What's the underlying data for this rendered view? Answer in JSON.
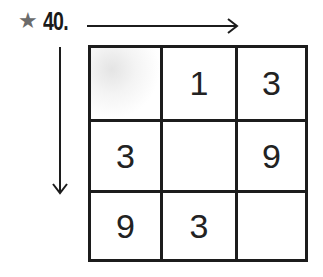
{
  "problem": {
    "marker_icon": "star-icon",
    "number": "40.",
    "row_arrow": "right-arrow",
    "column_arrow": "down-arrow"
  },
  "grid": {
    "rows": [
      [
        "",
        "1",
        "3"
      ],
      [
        "3",
        "",
        "9"
      ],
      [
        "9",
        "3",
        ""
      ]
    ]
  },
  "colors": {
    "ink": "#1c1c1c",
    "star": "#6b6b6b"
  }
}
